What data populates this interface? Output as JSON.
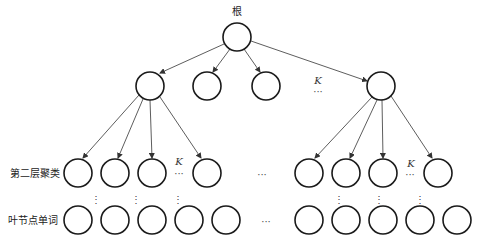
{
  "diagram": {
    "root_label": "根",
    "level2_label": "第二层聚类",
    "leaf_label": "叶节点单词",
    "k_symbol": "K",
    "ellipsis_h": "···",
    "ellipsis_v": "⋮",
    "line_color": "#333333",
    "node_stroke": "#1a1a1a"
  }
}
